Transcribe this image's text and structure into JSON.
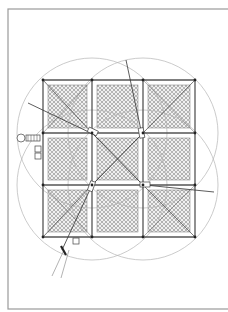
{
  "figure": {
    "type": "architectural-plan",
    "colors": {
      "background": "#ffffff",
      "frame": "#9a9a9a",
      "lines": "#444444",
      "circles": "#b4b4b4",
      "hatch": "#7a7a7a"
    }
  },
  "frame": {
    "x": 8,
    "y": 9,
    "width": 224,
    "height": 300
  },
  "grid": {
    "columns_x": [
      43,
      92,
      143,
      195
    ],
    "rows_y": [
      80,
      133,
      185,
      237
    ],
    "panels": 9
  },
  "circles": [
    {
      "cx": 92,
      "cy": 133,
      "r": 75
    },
    {
      "cx": 143,
      "cy": 133,
      "r": 75
    },
    {
      "cx": 92,
      "cy": 185,
      "r": 75
    },
    {
      "cx": 143,
      "cy": 185,
      "r": 75
    }
  ],
  "annotations": {
    "left_symbol": "circle-with-hatched-box",
    "side_boxes": 2,
    "bottom_box": 1
  }
}
